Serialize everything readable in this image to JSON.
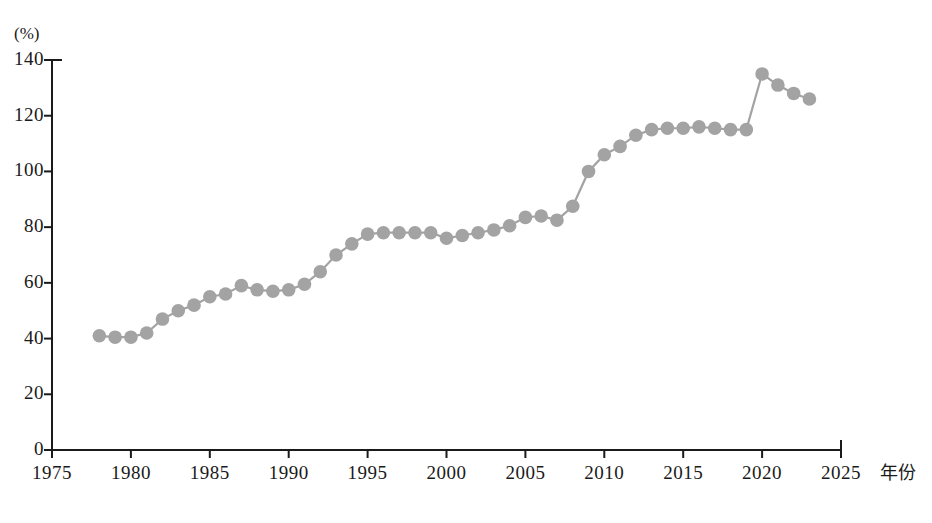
{
  "chart_data": {
    "type": "line",
    "title": "",
    "subtitle": "",
    "xlabel": "年份",
    "ylabel": "",
    "yunit": "(%)",
    "xlim": [
      1975,
      2025
    ],
    "ylim": [
      0,
      140
    ],
    "grid": false,
    "legend": null,
    "xticks": [
      "1975",
      "1980",
      "1985",
      "1990",
      "1995",
      "2000",
      "2005",
      "2010",
      "2015",
      "2020",
      "2025"
    ],
    "xtick_values": [
      1975,
      1980,
      1985,
      1990,
      1995,
      2000,
      2005,
      2010,
      2015,
      2020,
      2025
    ],
    "yticks": [
      "0",
      "20",
      "40",
      "60",
      "80",
      "100",
      "120",
      "140"
    ],
    "ytick_values": [
      0,
      20,
      40,
      60,
      80,
      100,
      120,
      140
    ],
    "marker": "circle",
    "marker_color": "#a3a3a3",
    "line_color": "#a3a3a3",
    "x": [
      1978,
      1979,
      1980,
      1981,
      1982,
      1983,
      1984,
      1985,
      1986,
      1987,
      1988,
      1989,
      1990,
      1991,
      1992,
      1993,
      1994,
      1995,
      1996,
      1997,
      1998,
      1999,
      2000,
      2001,
      2002,
      2003,
      2004,
      2005,
      2006,
      2007,
      2008,
      2009,
      2010,
      2011,
      2012,
      2013,
      2014,
      2015,
      2016,
      2017,
      2018,
      2019,
      2020,
      2021,
      2022,
      2023
    ],
    "values": [
      41,
      40.5,
      40.5,
      42,
      47,
      50,
      52,
      55,
      56,
      59,
      57.5,
      57,
      57.5,
      59.5,
      64,
      70,
      74,
      77.5,
      78,
      78,
      78,
      78,
      76,
      77,
      78,
      79,
      80.5,
      83.5,
      84,
      82.5,
      87.5,
      100,
      106,
      109,
      113,
      115,
      115.5,
      115.5,
      116,
      115.5,
      115,
      115,
      135,
      131,
      128,
      126
    ]
  },
  "axis": {
    "y_unit_label": "(%)",
    "x_axis_title": "年份"
  },
  "caption": {
    "text": ""
  }
}
